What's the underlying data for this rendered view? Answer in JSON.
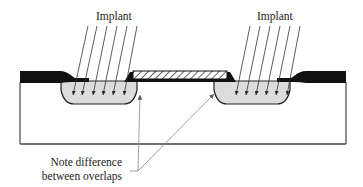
{
  "diagram": {
    "type": "ion-implantation-cross-section",
    "labels": {
      "implant_left": "Implant",
      "implant_right": "Implant",
      "note_line1": "Note difference",
      "note_line2": "between overlaps"
    },
    "colors": {
      "oxide": "#111111",
      "implant_region": "#dcdcdc",
      "substrate_outline": "#555555",
      "leader_line": "#888888",
      "arrows": "#333333"
    }
  }
}
